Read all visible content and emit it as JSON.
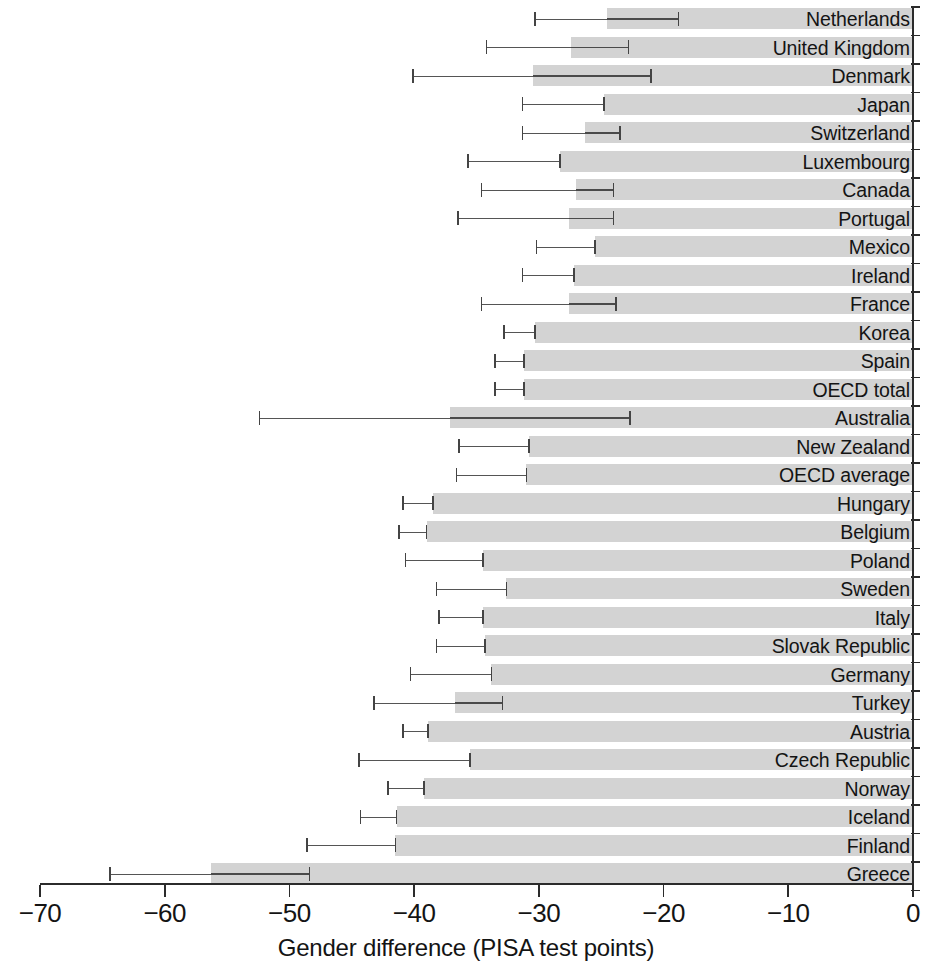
{
  "chart": {
    "type": "bar",
    "orientation": "horizontal",
    "xlabel": "Gender difference (PISA test points)",
    "ylabel": "",
    "title": "",
    "grid": false,
    "legend": null,
    "xlim": [
      -70,
      0
    ],
    "xticks": [
      "-70",
      "-60",
      "-50",
      "-40",
      "-30",
      "-20",
      "-10",
      "0"
    ],
    "xtick_values": [
      -70,
      -60,
      -50,
      -40,
      -30,
      -20,
      -10,
      0
    ],
    "bar_color": "#d3d3d3",
    "errorbar_color": "#4a4a4a",
    "axis_color": "#2b2b2b"
  },
  "chart_data": {
    "type": "bar",
    "orientation": "horizontal",
    "title": "",
    "xlabel": "Gender difference (PISA test points)",
    "ylabel": "",
    "xlim": [
      -70,
      0
    ],
    "xticks": [
      -70,
      -60,
      -50,
      -40,
      -30,
      -20,
      -10,
      0
    ],
    "grid": false,
    "legend_position": "none",
    "categories": [
      "Netherlands",
      "United Kingdom",
      "Denmark",
      "Japan",
      "Switzerland",
      "Luxembourg",
      "Canada",
      "Portugal",
      "Mexico",
      "Ireland",
      "France",
      "Korea",
      "Spain",
      "OECD total",
      "Australia",
      "New Zealand",
      "OECD average",
      "Hungary",
      "Belgium",
      "Poland",
      "Sweden",
      "Italy",
      "Slovak Republic",
      "Germany",
      "Turkey",
      "Austria",
      "Czech Republic",
      "Norway",
      "Iceland",
      "Finland",
      "Greece"
    ],
    "values": [
      -24.5,
      -27.4,
      -30.5,
      -24.8,
      -26.3,
      -28.3,
      -27.0,
      -27.6,
      -25.5,
      -27.2,
      -27.6,
      -30.3,
      -31.2,
      -31.2,
      -37.1,
      -30.8,
      -31.0,
      -38.5,
      -39.0,
      -34.5,
      -32.6,
      -34.5,
      -34.3,
      -33.8,
      -36.7,
      -38.9,
      -35.5,
      -39.2,
      -41.4,
      -41.5,
      -56.3
    ],
    "error_low": [
      -30.3,
      -34.2,
      -40.1,
      -31.3,
      -31.3,
      -35.7,
      -34.6,
      -36.5,
      -30.2,
      -31.3,
      -34.6,
      -32.8,
      -33.5,
      -33.5,
      -52.4,
      -36.4,
      -36.6,
      -40.9,
      -41.2,
      -40.7,
      -38.2,
      -38.0,
      -38.2,
      -40.3,
      -43.2,
      -40.9,
      -44.4,
      -42.1,
      -44.3,
      -48.6,
      -64.4
    ],
    "error_high": [
      -18.8,
      -22.8,
      -21.0,
      -24.8,
      -23.5,
      -28.3,
      -24.0,
      -24.0,
      -25.5,
      -27.2,
      -23.8,
      -30.3,
      -31.2,
      -31.2,
      -22.7,
      -30.8,
      -31.0,
      -38.5,
      -39.0,
      -34.5,
      -32.6,
      -34.5,
      -34.3,
      -33.8,
      -32.9,
      -38.9,
      -35.5,
      -39.2,
      -41.4,
      -41.5,
      -48.4
    ],
    "series": [
      {
        "name": "Gender difference (PISA test points)",
        "values": [
          -24.5,
          -27.4,
          -30.5,
          -24.8,
          -26.3,
          -28.3,
          -27.0,
          -27.6,
          -25.5,
          -27.2,
          -27.6,
          -30.3,
          -31.2,
          -31.2,
          -37.1,
          -30.8,
          -31.0,
          -38.5,
          -39.0,
          -34.5,
          -32.6,
          -34.5,
          -34.3,
          -33.8,
          -36.7,
          -38.9,
          -35.5,
          -39.2,
          -41.4,
          -41.5,
          -56.3
        ]
      }
    ]
  }
}
